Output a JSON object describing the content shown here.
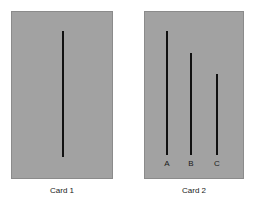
{
  "figure": {
    "background_color": "#ffffff",
    "card_fill_color": "#a2a2a2",
    "card_border_color": "#8b8b8b",
    "line_color": "#111111"
  },
  "cards": [
    {
      "id": "card-1",
      "caption": "Card 1",
      "x": 11,
      "y": 11,
      "width": 102,
      "height": 168,
      "lines": [
        {
          "label": "",
          "x": 62,
          "top": 31,
          "bottom": 157,
          "length": 126,
          "thickness": 2
        }
      ]
    },
    {
      "id": "card-2",
      "caption": "Card 2",
      "x": 144,
      "y": 11,
      "width": 100,
      "height": 168,
      "lines": [
        {
          "label": "A",
          "x": 166,
          "top": 31,
          "bottom": 155,
          "length": 124,
          "thickness": 2,
          "label_y": 160
        },
        {
          "label": "B",
          "x": 190,
          "top": 53,
          "bottom": 155,
          "length": 102,
          "thickness": 2,
          "label_y": 160
        },
        {
          "label": "C",
          "x": 216,
          "top": 74,
          "bottom": 155,
          "length": 81,
          "thickness": 2,
          "label_y": 160
        }
      ]
    }
  ]
}
